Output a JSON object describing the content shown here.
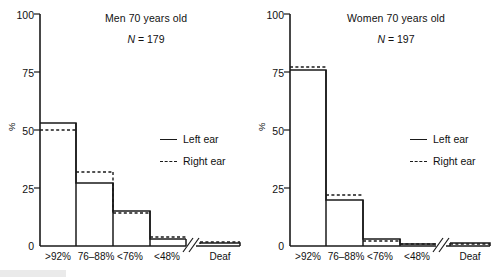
{
  "figure": {
    "ylabel": "%",
    "yticks": [
      0,
      25,
      50,
      75,
      100
    ],
    "ytick_labels": [
      "0",
      "25",
      "50",
      "75",
      "100"
    ],
    "categories": [
      "&gt;92%",
      "76–88%",
      "&lt;76%",
      "&lt;48%",
      "Deaf"
    ],
    "legend": {
      "left_label": "Left ear",
      "right_label": "Right ear"
    },
    "axis_break": true,
    "line_color": "#1a1a1a"
  },
  "panels": [
    {
      "id": "men",
      "title": "Men 70 years old",
      "n_symbol": "N",
      "n_text": "= 179"
    },
    {
      "id": "women",
      "title": "Women 70 years old",
      "n_symbol": "N",
      "n_text": "= 197"
    }
  ],
  "chart_data": [
    {
      "type": "bar",
      "title": "Men 70 years old",
      "subtitle": "N = 179",
      "xlabel": "",
      "ylabel": "%",
      "ylim": [
        0,
        100
      ],
      "yticks": [
        0,
        25,
        50,
        75,
        100
      ],
      "grid": false,
      "legend_position": "center-right",
      "categories": [
        ">92%",
        "76–88%",
        "<76%",
        "<48%",
        "Deaf"
      ],
      "series": [
        {
          "name": "Left ear",
          "style": "solid",
          "values": [
            53,
            27,
            15,
            3,
            1
          ]
        },
        {
          "name": "Right ear",
          "style": "dashed",
          "values": [
            50,
            32,
            14,
            4,
            1
          ]
        }
      ],
      "notes": "Step-outline histogram; axis break between <48% and Deaf"
    },
    {
      "type": "bar",
      "title": "Women 70 years old",
      "subtitle": "N = 197",
      "xlabel": "",
      "ylabel": "%",
      "ylim": [
        0,
        100
      ],
      "yticks": [
        0,
        25,
        50,
        75,
        100
      ],
      "grid": false,
      "legend_position": "center-right",
      "categories": [
        ">92%",
        "76–88%",
        "<76%",
        "<48%",
        "Deaf"
      ],
      "series": [
        {
          "name": "Left ear",
          "style": "solid",
          "values": [
            76,
            20,
            3,
            1,
            1
          ]
        },
        {
          "name": "Right ear",
          "style": "dashed",
          "values": [
            77,
            22,
            2,
            1,
            1
          ]
        }
      ],
      "notes": "Step-outline histogram; axis break between <48% and Deaf"
    }
  ]
}
